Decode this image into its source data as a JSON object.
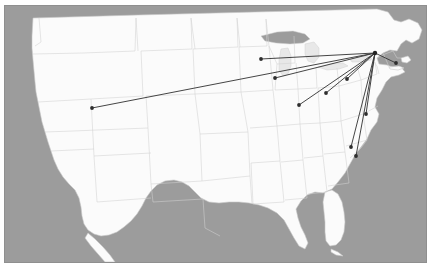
{
  "figure": {
    "title_fragment": "",
    "frame_color": "#8f8f8f",
    "ocean_color": "#9c9c9c",
    "land_color": "#fbfbfb",
    "state_border_color": "#d2d2d2",
    "route_color": "#3b3b3b",
    "node_color": "#2e2e2e",
    "width_px": 431,
    "height_px": 269
  },
  "map": {
    "type": "hub-and-spoke-route-map",
    "region": "Continental United States",
    "projection_note": "equirectangular-style US base map",
    "hub": {
      "name": "northeast-hub",
      "x": 375,
      "y": 53
    },
    "nodes": [
      {
        "name": "node-west-interior",
        "x": 92,
        "y": 108
      },
      {
        "name": "node-upper-midwest",
        "x": 261,
        "y": 59
      },
      {
        "name": "node-great-lakes",
        "x": 275,
        "y": 78
      },
      {
        "name": "node-lower-midwest",
        "x": 299,
        "y": 105
      },
      {
        "name": "node-ohio-valley",
        "x": 326,
        "y": 93
      },
      {
        "name": "node-mid-atlantic",
        "x": 347,
        "y": 79
      },
      {
        "name": "node-coastal-south",
        "x": 366,
        "y": 114
      },
      {
        "name": "node-carolina-west",
        "x": 351,
        "y": 147
      },
      {
        "name": "node-carolina-east",
        "x": 356,
        "y": 156
      },
      {
        "name": "node-new-england",
        "x": 396,
        "y": 63
      }
    ],
    "routes": [
      {
        "name": "route-hub-west-interior",
        "from": "northeast-hub",
        "to": "node-west-interior"
      },
      {
        "name": "route-hub-upper-midwest",
        "from": "northeast-hub",
        "to": "node-upper-midwest"
      },
      {
        "name": "route-hub-great-lakes",
        "from": "northeast-hub",
        "to": "node-great-lakes"
      },
      {
        "name": "route-hub-lower-midwest",
        "from": "northeast-hub",
        "to": "node-lower-midwest"
      },
      {
        "name": "route-hub-ohio-valley",
        "from": "northeast-hub",
        "to": "node-ohio-valley"
      },
      {
        "name": "route-hub-mid-atlantic",
        "from": "northeast-hub",
        "to": "node-mid-atlantic"
      },
      {
        "name": "route-hub-coastal-south",
        "from": "northeast-hub",
        "to": "node-coastal-south"
      },
      {
        "name": "route-hub-carolina-west",
        "from": "northeast-hub",
        "to": "node-carolina-west"
      },
      {
        "name": "route-hub-carolina-east",
        "from": "northeast-hub",
        "to": "node-carolina-east"
      },
      {
        "name": "route-hub-new-england",
        "from": "northeast-hub",
        "to": "node-new-england"
      }
    ],
    "counts": {
      "route_count": 10,
      "node_count": 10
    }
  }
}
